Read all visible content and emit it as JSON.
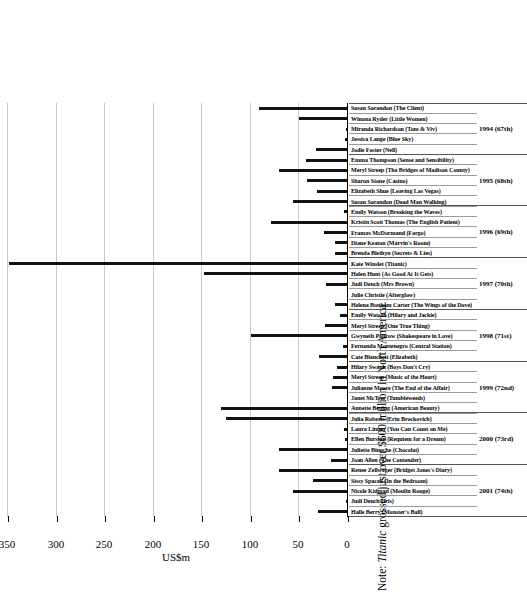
{
  "chart_data": {
    "type": "bar",
    "title": "",
    "xlabel": "",
    "ylabel": "US$m",
    "ylim": [
      0,
      350
    ],
    "grid": true,
    "orientation": "vertical-rotated-90ccw",
    "ticks": [
      "0",
      "50",
      "100",
      "150",
      "200",
      "250",
      "300",
      "350"
    ],
    "tick_values": [
      0,
      50,
      100,
      150,
      200,
      250,
      300,
      350
    ],
    "categories": [
      "Halle Berry (Monster's Ball)",
      "Judi Dench (Iris)",
      "Nicole Kidman (Moulin Rouge)",
      "Sissy Spacek (In the Bedroom)",
      "Renee Zellweger (Bridget Jones's Diary)",
      "Joan Allen (The Contender)",
      "Juliette Binoche (Chocolat)",
      "Ellen Burstyn (Requiem for a Dream)",
      "Laura Linney (You Can Count on Me)",
      "Julia Roberts (Erin Brockovich)",
      "Annette Bening (American Beauty)",
      "Janet McTeer (Tumbleweeds)",
      "Julianne Moore (The End of the Affair)",
      "Meryl Streep (Music of the Heart)",
      "Hilary Swank (Boys Don't Cry)",
      "Cate Blanchett (Elizabeth)",
      "Fernanda Montenegro (Central Station)",
      "Gwyneth Paltrow (Shakespeare in Love)",
      "Meryl Streep (One True Thing)",
      "Emily Watson (Hilary and Jackie)",
      "Helena Bonham Carter (The Wings of the Dove)",
      "Julie Christie (Afterglow)",
      "Judi Dench (Mrs Brown)",
      "Helen Hunt (As Good At It Gets)",
      "Kate Winslet (Titanic)",
      "Brenda Blethyn (Secrets & Lies)",
      "Diane Keaton (Marvin's Room)",
      "Frances McDormand (Fargo)",
      "Kristin Scott Thomas (The English Patient)",
      "Emily Watson (Breaking the Waves)",
      "Susan Sarandon (Dead Man Walking)",
      "Elizabeth Shue (Leaving Las Vegas)",
      "Sharon Stone (Casino)",
      "Meryl Streep (The Bridges of Madison County)",
      "Emma Thompson (Sense and Sensibility)",
      "Jodie Foster (Nell)",
      "Jessica Lange (Blue Sky)",
      "Miranda Richardson (Tom & Viv)",
      "Winona Ryder (Little Women)",
      "Susan Sarandon (The Client)"
    ],
    "values": [
      31,
      2,
      57,
      36,
      71,
      18,
      71,
      3,
      4,
      126,
      131,
      1,
      16,
      15,
      11,
      30,
      5,
      100,
      24,
      8,
      13,
      1,
      23,
      148,
      349,
      13,
      13,
      25,
      79,
      4,
      57,
      32,
      42,
      71,
      43,
      33,
      3,
      2,
      50,
      92
    ],
    "groups": [
      {
        "label": "2001 (74th)",
        "count": 5
      },
      {
        "label": "2000 (73rd)",
        "count": 5
      },
      {
        "label": "1999 (72nd)",
        "count": 5
      },
      {
        "label": "1998 (71st)",
        "count": 5
      },
      {
        "label": "1997 (70th)",
        "count": 5
      },
      {
        "label": "1996 (69th)",
        "count": 5
      },
      {
        "label": "1995 (68th)",
        "count": 5
      },
      {
        "label": "1994 (67th)",
        "count": 5
      }
    ],
    "bar_color": "#111111",
    "gridline_color": "#c9c9c9"
  },
  "note": {
    "prefix": "Note: ",
    "emphasis": "Titanic",
    "suffix": " grossed just over $600 million in North America."
  }
}
